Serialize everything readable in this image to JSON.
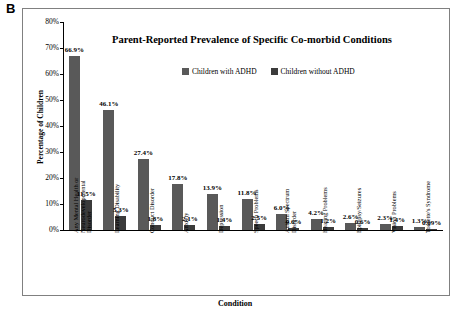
{
  "panel": {
    "label": "B"
  },
  "chart_data": {
    "type": "bar",
    "title": "Parent-Reported Prevalence of Specific Co-morbid Conditions",
    "xlabel": "Condition",
    "ylabel": "Percentage of Children",
    "ylim": [
      0,
      80
    ],
    "ytick_labels": [
      "0%",
      "10%",
      "20%",
      "30%",
      "40%",
      "50%",
      "60%",
      "70%",
      "80%"
    ],
    "ytick_values": [
      0,
      10,
      20,
      30,
      40,
      50,
      60,
      70,
      80
    ],
    "grid": false,
    "legend_position": "top-center",
    "categories": [
      "Any Mental Health or Neurodevelopmental Disorder",
      "Learning Disability",
      "Conduct Disorder",
      "Anxiety",
      "Depression",
      "Speech Problems",
      "Autism Spectrum Disorder",
      "Hearing Problems",
      "Epilepsy/Seizures",
      "Vision Problems",
      "Tourette's Syndrome"
    ],
    "category_lines": [
      [
        "Any Mental Health or",
        "Neurodevelopmental",
        "Disorder"
      ],
      [
        "Learning Disability"
      ],
      [
        "Conduct Disorder"
      ],
      [
        "Anxiety"
      ],
      [
        "Depression"
      ],
      [
        "Speech Problems"
      ],
      [
        "Autism Spectrum",
        "Disorder"
      ],
      [
        "Hearing Problems"
      ],
      [
        "Epilepsy/Seizures"
      ],
      [
        "Vision Problems"
      ],
      [
        "Tourette's Syndrome"
      ]
    ],
    "series": [
      {
        "name": "Children with ADHD",
        "color": "#595959",
        "values": [
          66.9,
          46.1,
          27.4,
          17.8,
          13.9,
          11.8,
          6.0,
          4.2,
          2.6,
          2.3,
          1.3
        ],
        "labels": [
          "66.9%",
          "46.1%",
          "27.4%",
          "17.8%",
          "13.9%",
          "11.8%",
          "6.0%",
          "4.2%",
          "2.6%",
          "2.3%",
          "1.3%"
        ]
      },
      {
        "name": "Children without ADHD",
        "color": "#3b3b3b",
        "values": [
          11.5,
          5.3,
          1.8,
          2.1,
          1.4,
          2.5,
          0.6,
          1.2,
          0.6,
          1.4,
          0.09
        ],
        "labels": [
          "11.5%",
          "5.3%",
          "1.8%",
          "2.1%",
          "1.4%",
          "2.5%",
          "0.6%",
          "1.2%",
          "0.6%",
          "1.4%",
          "0.09%"
        ]
      }
    ]
  }
}
